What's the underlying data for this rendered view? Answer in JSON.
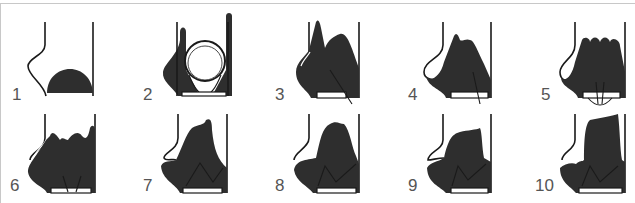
{
  "diagram": {
    "type": "sequential stage illustration",
    "rows": 2,
    "panels_per_row": 5,
    "colors": {
      "fill": "#2e2e2e",
      "line": "#1a1a1a",
      "label": "#555555",
      "frame": "#c8c8c8"
    },
    "panels": [
      {
        "label": "1"
      },
      {
        "label": "2"
      },
      {
        "label": "3"
      },
      {
        "label": "4"
      },
      {
        "label": "5"
      },
      {
        "label": "6"
      },
      {
        "label": "7"
      },
      {
        "label": "8"
      },
      {
        "label": "9"
      },
      {
        "label": "10"
      }
    ]
  }
}
